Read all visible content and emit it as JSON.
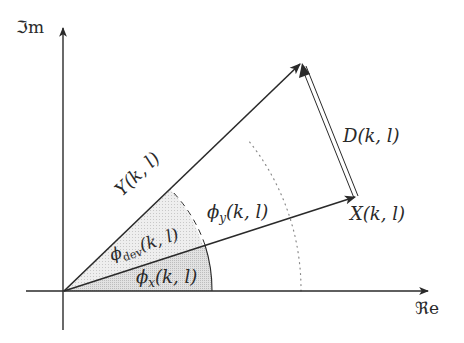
{
  "diagram": {
    "axes": {
      "imag_label": "ℑm",
      "real_label": "ℜe"
    },
    "vectors": {
      "Y": {
        "label": "Y(k, l)"
      },
      "X": {
        "label": "X(k, l)"
      },
      "D": {
        "label": "D(k, l)"
      }
    },
    "angles": {
      "phi_x": {
        "symbol": "ϕ",
        "sub": "x",
        "args": "(k, l)"
      },
      "phi_dev": {
        "symbol": "ϕ",
        "sub": "dev",
        "args": "(k, l)"
      },
      "phi_y": {
        "symbol": "ϕ",
        "sub": "y",
        "args": "(k, l)"
      }
    },
    "colors": {
      "line": "#2a2a2a",
      "shade_light": "#ececec",
      "shade_dark": "#d9d9d9",
      "dotted": "#8a8a8a"
    }
  }
}
